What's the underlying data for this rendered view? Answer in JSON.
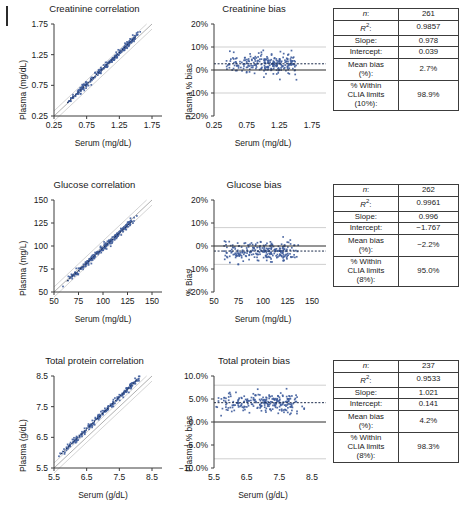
{
  "figure": {
    "panel_label_mark": "vertical-bar",
    "marker_color": "#3f5d9c",
    "identity_line_color": "#9a9a9a",
    "limit_line_color": "#c9c9c9",
    "axis_color": "#3c3c3c"
  },
  "rows": [
    {
      "id": "creatinine",
      "correlation": {
        "title": "Creatinine correlation",
        "xlabel": "Serum (mg/dL)",
        "ylabel": "Plasma (mg/dL)",
        "xticks": [
          "0.25",
          "0.75",
          "1.25",
          "1.75"
        ],
        "yticks": [
          "1.75",
          "1.25",
          "0.75",
          "0.25"
        ],
        "xlim": [
          0.25,
          1.75
        ],
        "ylim": [
          0.25,
          1.75
        ]
      },
      "bias": {
        "title": "Creatinine bias",
        "xlabel": "Serum (mg/dL)",
        "ylabel": "Plasma % bias",
        "xticks": [
          "0.25",
          "0.75",
          "1.25",
          "1.75"
        ],
        "yticks": [
          "20%",
          "10%",
          "0%",
          "−10%",
          "−20%"
        ],
        "xlim": [
          0.25,
          1.75
        ],
        "ylim": [
          -20,
          20
        ],
        "mean_bias_line": 2.7,
        "clia_limits": [
          10,
          -10
        ]
      },
      "table": {
        "rows": [
          {
            "key": "n:",
            "key_italic": true,
            "value": "261"
          },
          {
            "key": "R2:",
            "key_r2": true,
            "value": "0.9857"
          },
          {
            "key": "Slope:",
            "value": "0.978"
          },
          {
            "key": "Intercept:",
            "value": "0.039"
          },
          {
            "key": "Mean bias (%):",
            "value": "2.7%"
          },
          {
            "key": "% Within CLIA limits (10%):",
            "value": "98.9%"
          }
        ]
      }
    },
    {
      "id": "glucose",
      "correlation": {
        "title": "Glucose correlation",
        "xlabel": "Serum (mg/dL)",
        "ylabel": "Plasma (mg/L)",
        "xticks": [
          "50",
          "75",
          "100",
          "125",
          "150"
        ],
        "yticks": [
          "150",
          "125",
          "100",
          "75",
          "50"
        ],
        "xlim": [
          50,
          150
        ],
        "ylim": [
          50,
          150
        ]
      },
      "bias": {
        "title": "Glucose bias",
        "xlabel": "Serum (mg/dL)",
        "ylabel": "% Bias",
        "xticks": [
          "50",
          "75",
          "100",
          "125",
          "150"
        ],
        "yticks": [
          "20%",
          "10%",
          "0%",
          "−10%",
          "−20%"
        ],
        "xlim": [
          50,
          150
        ],
        "ylim": [
          -20,
          20
        ],
        "mean_bias_line": -2.2,
        "clia_limits": [
          8,
          -8
        ]
      },
      "table": {
        "rows": [
          {
            "key": "n:",
            "key_italic": true,
            "value": "262"
          },
          {
            "key": "R2:",
            "key_r2": true,
            "value": "0.9961"
          },
          {
            "key": "Slope:",
            "value": "0.996"
          },
          {
            "key": "Intercept:",
            "value": "−1.767"
          },
          {
            "key": "Mean bias (%):",
            "value": "−2.2%"
          },
          {
            "key": "% Within CLIA limits (8%):",
            "value": "95.0%"
          }
        ]
      }
    },
    {
      "id": "total-protein",
      "correlation": {
        "title": "Total protein correlation",
        "xlabel": "Serum (g/dL)",
        "ylabel": "Plasma (g/dL)",
        "xticks": [
          "5.5",
          "6.5",
          "7.5",
          "8.5"
        ],
        "yticks": [
          "8.5",
          "7.5",
          "6.5",
          "5.5"
        ],
        "xlim": [
          5.5,
          8.5
        ],
        "ylim": [
          5.5,
          8.5
        ]
      },
      "bias": {
        "title": "Total protein bias",
        "xlabel": "Serum (g/dL)",
        "ylabel": "Plasma % bias",
        "xticks": [
          "5.5",
          "6.5",
          "7.5",
          "8.5"
        ],
        "yticks": [
          "10.0%",
          "5.0%",
          "0.0%",
          "−5.0%",
          "−10.0%"
        ],
        "xlim": [
          5.5,
          8.5
        ],
        "ylim": [
          -10,
          10
        ],
        "mean_bias_line": 4.2,
        "clia_limits": [
          8,
          -8
        ]
      },
      "table": {
        "rows": [
          {
            "key": "n:",
            "key_italic": true,
            "value": "237"
          },
          {
            "key": "R2:",
            "key_r2": true,
            "value": "0.9533"
          },
          {
            "key": "Slope:",
            "value": "1.021"
          },
          {
            "key": "Intercept:",
            "value": "0.141"
          },
          {
            "key": "Mean bias (%):",
            "value": "4.2%"
          },
          {
            "key": "% Within CLIA limits (8%):",
            "value": "98.3%"
          }
        ]
      }
    }
  ],
  "chart_data": {
    "type": "scatter",
    "panels": [
      {
        "analyte": "Creatinine",
        "unit": "mg/dL",
        "n": 261,
        "r_squared": 0.9857,
        "slope": 0.978,
        "intercept": 0.039,
        "mean_bias_pct": 2.7,
        "pct_within_clia": 98.9,
        "clia_limit_pct": 10,
        "corr_xlim": [
          0.25,
          1.75
        ],
        "corr_ylim": [
          0.25,
          1.75
        ],
        "bias_ylim": [
          -20,
          20
        ],
        "data_x_range": [
          0.45,
          1.5
        ],
        "cluster_center": [
          0.85,
          0.87
        ]
      },
      {
        "analyte": "Glucose",
        "unit": "mg/dL",
        "n": 262,
        "r_squared": 0.9961,
        "slope": 0.996,
        "intercept": -1.767,
        "mean_bias_pct": -2.2,
        "pct_within_clia": 95.0,
        "clia_limit_pct": 8,
        "corr_xlim": [
          50,
          150
        ],
        "corr_ylim": [
          50,
          150
        ],
        "bias_ylim": [
          -20,
          20
        ],
        "data_x_range": [
          63,
          130
        ],
        "cluster_center": [
          92,
          90
        ]
      },
      {
        "analyte": "Total protein",
        "unit": "g/dL",
        "n": 237,
        "r_squared": 0.9533,
        "slope": 1.021,
        "intercept": 0.141,
        "mean_bias_pct": 4.2,
        "pct_within_clia": 98.3,
        "clia_limit_pct": 8,
        "corr_xlim": [
          5.5,
          8.5
        ],
        "corr_ylim": [
          5.5,
          8.5
        ],
        "bias_ylim": [
          -10,
          10
        ],
        "data_x_range": [
          5.7,
          8.05
        ],
        "cluster_center": [
          7.0,
          7.25
        ]
      }
    ]
  }
}
